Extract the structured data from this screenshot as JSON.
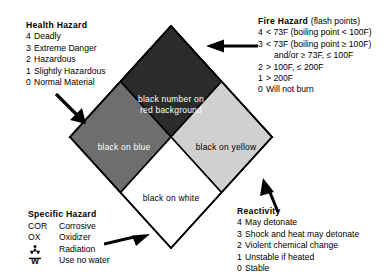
{
  "diagram": {
    "colors": {
      "fire_quadrant": "#2b2b2b",
      "health_quadrant": "#6e6e6e",
      "reactivity_quadrant": "#d0d0d0",
      "specific_quadrant": "#ffffff",
      "outline": "#000000",
      "text": "#000000"
    }
  },
  "quadrant_labels": {
    "fire": "black number on",
    "fire2": "red background",
    "health": "black on blue",
    "reactivity": "black on yellow",
    "specific": "black on white"
  },
  "health": {
    "heading": "Health  Hazard",
    "levels": [
      {
        "level": "4",
        "text": "Deadly"
      },
      {
        "level": "3",
        "text": "Extreme Danger"
      },
      {
        "level": "2",
        "text": "Hazardous"
      },
      {
        "level": "1",
        "text": "Slightly Hazardous"
      },
      {
        "level": "0",
        "text": "Normal Material"
      }
    ]
  },
  "fire": {
    "heading": "Fire  Hazard",
    "heading_note": "(flash points)",
    "levels": [
      {
        "level": "4",
        "text": "< 73F (boiling point < 100F)"
      },
      {
        "level": "3",
        "text": "< 73F (boiling point ≥ 100F)"
      },
      {
        "level": "",
        "text": "and/or ≥ 73F, ≤ 100F"
      },
      {
        "level": "2",
        "text": "> 100F, ≤ 200F"
      },
      {
        "level": "1",
        "text": "> 200F"
      },
      {
        "level": "0",
        "text": "Will not burn"
      }
    ]
  },
  "reactivity": {
    "heading": "Reactivity",
    "levels": [
      {
        "level": "4",
        "text": "May detonate"
      },
      {
        "level": "3",
        "text": "Shock and heat may detonate"
      },
      {
        "level": "2",
        "text": "Violent chemical change"
      },
      {
        "level": "1",
        "text": "Unstable if heated"
      },
      {
        "level": "0",
        "text": "Stable"
      }
    ]
  },
  "specific": {
    "heading": "Specific  Hazard",
    "items": [
      {
        "code": "COR",
        "desc": "Corrosive",
        "icon": ""
      },
      {
        "code": "OX",
        "desc": "Oxidizer",
        "icon": ""
      },
      {
        "code": "",
        "desc": "Radiation",
        "icon": "radiation-trefoil-icon"
      },
      {
        "code": "",
        "desc": "Use no water",
        "icon": "no-water-w-icon"
      }
    ]
  }
}
